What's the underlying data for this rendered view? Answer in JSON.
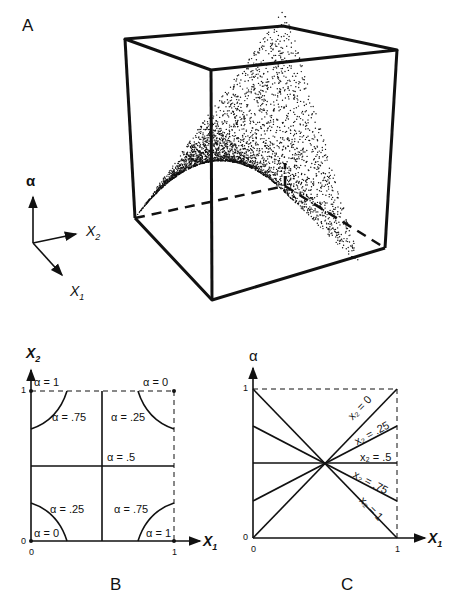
{
  "figure": {
    "panels": [
      {
        "id": "A",
        "label": "A",
        "type": "3d-surface",
        "axes_indicator": {
          "up": "α",
          "right": "X2",
          "down": "X1"
        },
        "description": "Saddle-shaped surface of dots inside a unit cube"
      },
      {
        "id": "B",
        "label": "B",
        "type": "contour",
        "x_axis": "X1",
        "y_axis": "X2",
        "ticks": {
          "x": [
            "0",
            "1"
          ],
          "y": [
            "0",
            "1"
          ]
        },
        "labels": [
          "α = 1",
          "α = 0",
          "α = .75",
          "α = .25",
          "α = .5",
          "α = .25",
          "α = .75",
          "α = 0",
          "α = 1"
        ]
      },
      {
        "id": "C",
        "label": "C",
        "type": "line",
        "x_axis": "X1",
        "y_axis": "α",
        "ticks": {
          "x": [
            "0",
            "1"
          ],
          "y": [
            "0",
            "1"
          ]
        },
        "line_labels": [
          "x2 = 0",
          "x2 = .25",
          "x2 = .5",
          "x2 = .75",
          "x2 = 1"
        ]
      }
    ]
  },
  "chart_data": [
    {
      "type": "line",
      "title": "C",
      "xlabel": "X1",
      "ylabel": "α",
      "xlim": [
        0,
        1
      ],
      "ylim": [
        0,
        1
      ],
      "x": [
        0,
        1
      ],
      "series": [
        {
          "name": "x2 = 0",
          "values": [
            0,
            1
          ]
        },
        {
          "name": "x2 = .25",
          "values": [
            0.25,
            0.75
          ]
        },
        {
          "name": "x2 = .5",
          "values": [
            0.5,
            0.5
          ]
        },
        {
          "name": "x2 = .75",
          "values": [
            0.75,
            0.25
          ]
        },
        {
          "name": "x2 = 1",
          "values": [
            1,
            0
          ]
        }
      ]
    },
    {
      "type": "heatmap",
      "title": "B",
      "xlabel": "X1",
      "ylabel": "X2",
      "xlim": [
        0,
        1
      ],
      "ylim": [
        0,
        1
      ],
      "corners": [
        {
          "x1": 0,
          "x2": 1,
          "alpha": 1
        },
        {
          "x1": 1,
          "x2": 1,
          "alpha": 0
        },
        {
          "x1": 0,
          "x2": 0,
          "alpha": 0
        },
        {
          "x1": 1,
          "x2": 0,
          "alpha": 1
        }
      ],
      "contours": [
        0,
        0.25,
        0.5,
        0.75,
        1
      ]
    }
  ],
  "text": {
    "A": "A",
    "B": "B",
    "C": "C",
    "alpha": "α",
    "x1": "X",
    "x2": "X",
    "sub1": "1",
    "sub2": "2",
    "zero": "0",
    "one": "1",
    "b_a1_tl": "α = 1",
    "b_a0_tr": "α = 0",
    "b_a75_tl": "α = .75",
    "b_a25_tr": "α = .25",
    "b_a5": "α = .5",
    "b_a25_bl": "α = .25",
    "b_a75_br": "α = .75",
    "b_a0_bl": "α = 0",
    "b_a1_br": "α = 1",
    "c_l0": "x₂ = 0",
    "c_l25": "x₂ = .25",
    "c_l5": "x₂ = .5",
    "c_l75": "x₂ = .75",
    "c_l1": "x₂ = 1"
  }
}
